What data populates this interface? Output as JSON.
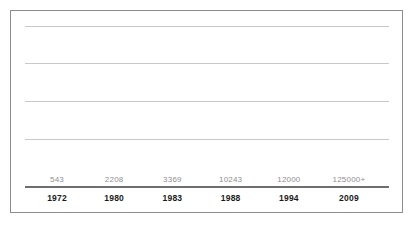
{
  "figure": {
    "border_color": "#8c8c8c",
    "background_color": "#ffffff"
  },
  "chart_data": {
    "type": "bar",
    "title": "",
    "subtitle": "",
    "xlabel": "",
    "ylabel": "",
    "categories": [
      "1972",
      "1980",
      "1983",
      "1988",
      "1994",
      "2009"
    ],
    "values": [
      543,
      2208,
      3369,
      10243,
      12000,
      125000
    ],
    "data_labels": [
      "543",
      "2208",
      "3369",
      "10243",
      "12000",
      "125000+"
    ],
    "ylim": [
      0,
      145000
    ],
    "grid": true,
    "gridlines_count": 4,
    "legend": null,
    "legend_position": "none",
    "bar_color": "#7a7a7a",
    "value_label_color": "#8f8f8f",
    "tick_label_color": "#1a1a1a",
    "axis_color": "#6e6e6e",
    "gridline_color": "#c9c9c9",
    "annotations": []
  },
  "bars": [
    {
      "category": "1972",
      "value": 543,
      "label": "543",
      "center_pct": 8.8,
      "width_pct": 11.0,
      "height_pct": 0.45
    },
    {
      "category": "1980",
      "value": 2208,
      "label": "2208",
      "center_pct": 24.5,
      "width_pct": 11.0,
      "height_pct": 1.8
    },
    {
      "category": "1983",
      "value": 3369,
      "label": "3369",
      "center_pct": 40.5,
      "width_pct": 11.0,
      "height_pct": 2.7
    },
    {
      "category": "1988",
      "value": 10243,
      "label": "10243",
      "center_pct": 56.5,
      "width_pct": 11.0,
      "height_pct": 8.2
    },
    {
      "category": "1994",
      "value": 12000,
      "label": "12000",
      "center_pct": 72.5,
      "width_pct": 11.0,
      "height_pct": 9.6
    },
    {
      "category": "2009",
      "value": 125000,
      "label": "125000+",
      "center_pct": 89.0,
      "width_pct": 11.0,
      "height_pct": 86.0
    }
  ],
  "gridlines": [
    {
      "top_pct": 5.6
    },
    {
      "top_pct": 24.6
    },
    {
      "top_pct": 44.1
    },
    {
      "top_pct": 63.6
    }
  ]
}
